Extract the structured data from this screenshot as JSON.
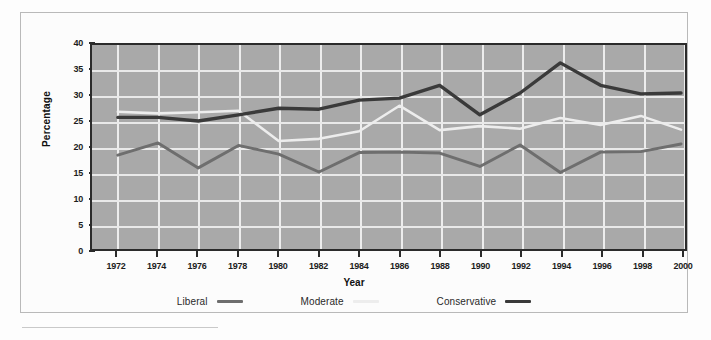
{
  "chart_data": {
    "type": "line",
    "title": "",
    "xlabel": "Year",
    "ylabel": "Percentage",
    "categories": [
      1972,
      1974,
      1976,
      1978,
      1980,
      1982,
      1984,
      1986,
      1988,
      1990,
      1992,
      1994,
      1996,
      1998,
      2000
    ],
    "x": [
      1972,
      1974,
      1976,
      1978,
      1980,
      1982,
      1984,
      1986,
      1988,
      1990,
      1992,
      1994,
      1996,
      1998,
      2000
    ],
    "xlim": [
      1971,
      2001
    ],
    "ylim": [
      0,
      40
    ],
    "yticks": [
      0,
      5,
      10,
      15,
      20,
      25,
      30,
      35,
      40
    ],
    "xticks": [
      1972,
      1974,
      1976,
      1978,
      1980,
      1982,
      1984,
      1986,
      1988,
      1990,
      1992,
      1994,
      1996,
      1998,
      2000
    ],
    "grid": true,
    "legend_position": "bottom",
    "series": [
      {
        "name": "Liberal",
        "color": "#6e6e6e",
        "values": [
          18.4,
          20.8,
          15.9,
          20.3,
          18.6,
          15.1,
          18.9,
          19.0,
          18.8,
          16.2,
          20.4,
          15.0,
          19.0,
          19.1,
          20.6
        ]
      },
      {
        "name": "Moderate",
        "color": "#ededed",
        "values": [
          26.9,
          26.6,
          26.8,
          27.1,
          21.2,
          21.6,
          23.1,
          28.1,
          23.3,
          24.1,
          23.6,
          25.7,
          24.3,
          26.1,
          23.4
        ]
      },
      {
        "name": "Conservative",
        "color": "#3a3a3a",
        "values": [
          25.8,
          25.8,
          25.1,
          26.3,
          27.6,
          27.4,
          29.2,
          29.6,
          32.1,
          26.3,
          30.6,
          36.5,
          32.1,
          30.4,
          30.6
        ]
      }
    ]
  },
  "axis": {
    "y_label": "Percentage",
    "x_label": "Year",
    "y_tick_labels": [
      "40",
      "35",
      "30",
      "25",
      "20",
      "15",
      "10",
      "5",
      "0"
    ],
    "x_tick_labels": [
      "1972",
      "1974",
      "1976",
      "1978",
      "1980",
      "1982",
      "1984",
      "1986",
      "1988",
      "1990",
      "1992",
      "1994",
      "1996",
      "1998",
      "2000"
    ]
  },
  "legend": {
    "items": [
      {
        "label": "Liberal",
        "color": "#6e6e6e"
      },
      {
        "label": "Moderate",
        "color": "#ededed"
      },
      {
        "label": "Conservative",
        "color": "#3a3a3a"
      }
    ]
  },
  "colors": {
    "plot_background": "#a9a9a9",
    "gridline": "#e9e9e9",
    "axis": "#2b2b2b",
    "page_background": "#fdfdfd"
  }
}
